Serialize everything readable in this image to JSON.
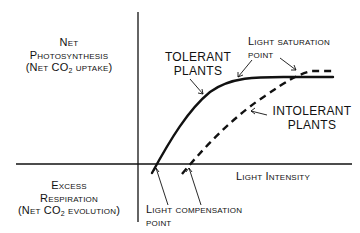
{
  "diagram": {
    "y_axis_top_label": {
      "line1": "Net",
      "line2": "Photosynthesis",
      "line3_prefix": "(Net CO",
      "line3_sub": "2",
      "line3_suffix": " uptake)"
    },
    "y_axis_bottom_label": {
      "line1": "Excess",
      "line2": "Respiration",
      "line3_prefix": "(Net CO",
      "line3_sub": "2",
      "line3_suffix": " evolution)"
    },
    "x_axis_label": "Light Intensity",
    "curves": [
      {
        "name": "TOLERANT PLANTS",
        "style": "solid",
        "line1": "TOLERANT",
        "line2": "PLANTS"
      },
      {
        "name": "INTOLERANT PLANTS",
        "style": "dashed",
        "line1": "INTOLERANT",
        "line2": "PLANTS"
      }
    ],
    "annotations": {
      "saturation": {
        "line1": "Light saturation",
        "line2": "point"
      },
      "compensation": {
        "line1": "Light compensation",
        "line2": "point"
      }
    },
    "colors": {
      "ink": "#111111",
      "background": "#ffffff"
    }
  }
}
